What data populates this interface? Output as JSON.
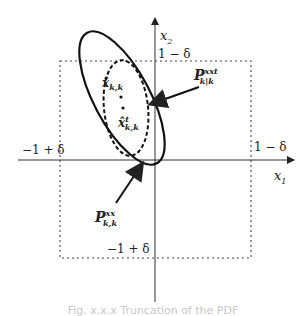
{
  "diagram": {
    "axes": {
      "x_label": "x",
      "x_sub": "1",
      "y_label": "x",
      "y_sub": "2"
    },
    "bounds": {
      "top": "1 − δ",
      "right": "1 − δ",
      "left": "−1 + δ",
      "bottom": "−1 + δ"
    },
    "points": {
      "estimate": {
        "base": "x̂",
        "sub": "k,k",
        "sup": ""
      },
      "truncated_estimate": {
        "base": "x̂",
        "sub": "k,k",
        "sup": "t"
      }
    },
    "annotations": {
      "truncated_cov": {
        "base": "P",
        "sup": "xxt",
        "sub": "k|k"
      },
      "original_cov": {
        "base": "P",
        "sup": "xx",
        "sub": "k,k"
      }
    },
    "caption": "Fig. x.x.x  Truncation of the PDF"
  }
}
